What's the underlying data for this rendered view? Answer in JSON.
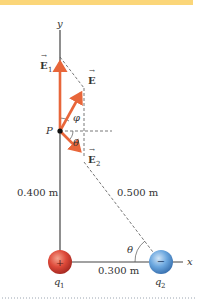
{
  "colors": {
    "top_bar": "#fbd679",
    "axis": "#444444",
    "vector": "#e8663a",
    "dashed": "#555555",
    "charge_positive": "#d9473a",
    "charge_negative": "#5a9ad6",
    "dotted_rule": "#9aa4b0"
  },
  "axes": {
    "y_label": "y",
    "x_label": "x"
  },
  "point": {
    "label": "P"
  },
  "vectors": {
    "e1": {
      "label": "E",
      "subscript": "1"
    },
    "e": {
      "label": "E"
    },
    "e2": {
      "label": "E",
      "subscript": "2"
    }
  },
  "angles": {
    "phi": "φ",
    "theta_at_p": "θ",
    "theta_at_q2": "θ"
  },
  "distances": {
    "vertical": "0.400 m",
    "hypotenuse": "0.500 m",
    "horizontal": "0.300 m"
  },
  "charges": {
    "q1": {
      "name": "q",
      "subscript": "1",
      "sign": "+"
    },
    "q2": {
      "name": "q",
      "subscript": "2",
      "sign": "−"
    }
  }
}
